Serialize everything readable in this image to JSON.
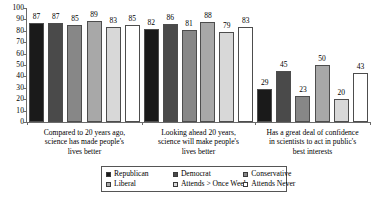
{
  "chart_data": {
    "type": "bar",
    "title": "",
    "subtitle": "",
    "xlabel": "",
    "ylabel": "",
    "ylim": [
      0,
      100
    ],
    "yticks": [
      0,
      10,
      20,
      30,
      40,
      50,
      60,
      70,
      80,
      90,
      100
    ],
    "grid": false,
    "legend_position": "bottom-center",
    "categories": [
      "Compared to 20 years ago, science has made people's lives better",
      "Looking ahead 20 years, science will make people's lives better",
      "Has a great deal of confidence in scientists to act in public's best interests"
    ],
    "categories_lines": [
      [
        "Compared to 20 years ago,",
        "science has made people's",
        "lives better"
      ],
      [
        "Looking ahead 20 years,",
        "science will make people's",
        "lives better"
      ],
      [
        "Has a great deal of confidence",
        "in scientists to act in public's",
        "best interests"
      ]
    ],
    "series": [
      {
        "name": "Republican",
        "color": "#1a1a1a",
        "values": [
          87,
          82,
          29
        ]
      },
      {
        "name": "Democrat",
        "color": "#4a4a4a",
        "values": [
          87,
          86,
          45
        ]
      },
      {
        "name": "Conservative",
        "color": "#878787",
        "values": [
          85,
          81,
          23
        ]
      },
      {
        "name": "Liberal",
        "color": "#a8a8a8",
        "values": [
          89,
          88,
          50
        ]
      },
      {
        "name": "Attends > Once Week",
        "color": "#d8d8d8",
        "values": [
          83,
          79,
          20
        ]
      },
      {
        "name": "Attends Never",
        "color": "#ffffff",
        "values": [
          85,
          83,
          43
        ]
      }
    ],
    "legend_entries": [
      {
        "label": "Republican",
        "color": "#1a1a1a"
      },
      {
        "label": "Democrat",
        "color": "#4a4a4a"
      },
      {
        "label": "Conservative",
        "color": "#878787"
      },
      {
        "label": "Liberal",
        "color": "#a8a8a8"
      },
      {
        "label": "Attends > Once Week",
        "color": "#d8d8d8"
      },
      {
        "label": "Attends Never",
        "color": "#ffffff"
      }
    ],
    "axis_color": "#6b6b6b",
    "bar_border_color": "#4d4d4d"
  }
}
